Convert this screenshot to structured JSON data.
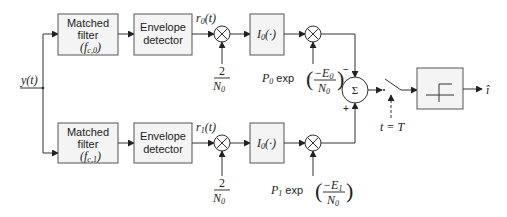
{
  "diagram": {
    "title": "",
    "input": {
      "label": "y(t)"
    },
    "output": {
      "label": "î",
      "symbol": "i-hat"
    },
    "branches": [
      {
        "id": "branch-0",
        "matched_filter": {
          "line1": "Matched",
          "line2": "filter",
          "param": "(f",
          "param_sub": "c,0",
          "param_close": ")"
        },
        "envelope_detector": {
          "line1": "Envelope",
          "line2": "detector"
        },
        "envelope_output": {
          "label": "r",
          "sub": "0",
          "arg": "(t)"
        },
        "scale_factor": {
          "num": "2",
          "den": "N",
          "den_sub": "0"
        },
        "bessel_block": {
          "label": "I",
          "sub": "0",
          "arg": "(·)"
        },
        "prior_weight": {
          "p": "P",
          "p_sub": "0",
          "exp": "exp",
          "num": "−E",
          "num_sub": "0",
          "den": "N",
          "den_sub": "0"
        },
        "sum_sign": "−"
      },
      {
        "id": "branch-1",
        "matched_filter": {
          "line1": "Matched",
          "line2": "filter",
          "param": "(f",
          "param_sub": "c,1",
          "param_close": ")"
        },
        "envelope_detector": {
          "line1": "Envelope",
          "line2": "detector"
        },
        "envelope_output": {
          "label": "r",
          "sub": "1",
          "arg": "(t)"
        },
        "scale_factor": {
          "num": "2",
          "den": "N",
          "den_sub": "0"
        },
        "bessel_block": {
          "label": "I",
          "sub": "0",
          "arg": "(·)"
        },
        "prior_weight": {
          "p": "P",
          "p_sub": "1",
          "exp": "exp",
          "num": "−E",
          "num_sub": "1",
          "den": "N",
          "den_sub": "0"
        },
        "sum_sign": "+"
      }
    ],
    "summer": {
      "symbol": "Σ"
    },
    "sampler": {
      "label": "t = T"
    },
    "decision": {
      "type": "threshold-step"
    }
  }
}
